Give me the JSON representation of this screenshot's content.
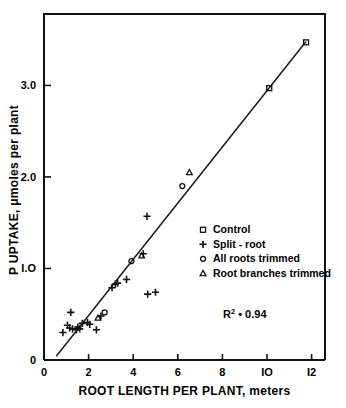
{
  "chart_data": {
    "type": "scatter",
    "title": "",
    "xlabel": "ROOT LENGTH PER PLANT, meters",
    "ylabel_line1": "P UPTAKE,",
    "ylabel_mu": "μ",
    "ylabel_line2": "moles",
    "ylabel_line3": "per plant",
    "ylabel_full": "P UPTAKE, μ moles per plant",
    "xlim": [
      0,
      12.6
    ],
    "ylim": [
      0,
      3.78
    ],
    "xticks": [
      0,
      2,
      4,
      6,
      8,
      10,
      12
    ],
    "xtick_labels": [
      "0",
      "2",
      "4",
      "6",
      "8",
      "IO",
      "I2"
    ],
    "yticks": [
      0,
      1.0,
      2.0,
      3.0
    ],
    "ytick_labels": [
      "0",
      "I.O",
      "2.0",
      "3.0"
    ],
    "grid": false,
    "legend_position": "center-right",
    "annotation": {
      "r_symbol": "R",
      "r_exponent": "2",
      "r_equals": "•",
      "r_value": "0.94",
      "full": "R² • 0.94"
    },
    "fit_line": {
      "x_start": 0.55,
      "y_start": 0.04,
      "x_end": 11.75,
      "y_end": 3.48
    },
    "series": [
      {
        "name": "Control",
        "marker": "square",
        "points": [
          {
            "x": 10.1,
            "y": 2.97
          },
          {
            "x": 11.75,
            "y": 3.47
          }
        ]
      },
      {
        "name": "Split - root",
        "marker": "plus",
        "points": [
          {
            "x": 0.85,
            "y": 0.3
          },
          {
            "x": 1.05,
            "y": 0.38
          },
          {
            "x": 1.15,
            "y": 0.35
          },
          {
            "x": 1.2,
            "y": 0.52
          },
          {
            "x": 1.28,
            "y": 0.34
          },
          {
            "x": 1.45,
            "y": 0.33
          },
          {
            "x": 1.52,
            "y": 0.36
          },
          {
            "x": 1.6,
            "y": 0.34
          },
          {
            "x": 1.72,
            "y": 0.4
          },
          {
            "x": 1.95,
            "y": 0.41
          },
          {
            "x": 2.05,
            "y": 0.39
          },
          {
            "x": 2.35,
            "y": 0.33
          },
          {
            "x": 2.55,
            "y": 0.48
          },
          {
            "x": 3.05,
            "y": 0.79
          },
          {
            "x": 3.2,
            "y": 0.83
          },
          {
            "x": 3.3,
            "y": 0.84
          },
          {
            "x": 3.7,
            "y": 0.88
          },
          {
            "x": 4.45,
            "y": 1.16
          },
          {
            "x": 4.62,
            "y": 1.57
          },
          {
            "x": 4.65,
            "y": 0.72
          },
          {
            "x": 5.0,
            "y": 0.74
          }
        ]
      },
      {
        "name": "All roots trimmed",
        "marker": "circle",
        "points": [
          {
            "x": 2.72,
            "y": 0.52
          },
          {
            "x": 3.92,
            "y": 1.08
          },
          {
            "x": 6.2,
            "y": 1.9
          }
        ]
      },
      {
        "name": "Root branches trimmed",
        "marker": "triangle",
        "points": [
          {
            "x": 2.42,
            "y": 0.46
          },
          {
            "x": 4.38,
            "y": 1.14
          },
          {
            "x": 6.52,
            "y": 2.05
          }
        ]
      }
    ],
    "legend": [
      {
        "label": "Control",
        "marker": "square"
      },
      {
        "label": "Split - root",
        "marker": "plus"
      },
      {
        "label": "All roots  trimmed",
        "marker": "circle"
      },
      {
        "label": "Root branches trimmed",
        "marker": "triangle"
      }
    ]
  }
}
